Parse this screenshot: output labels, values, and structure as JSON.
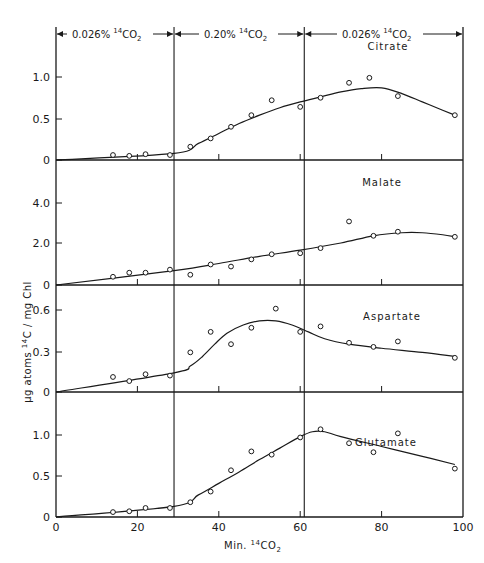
{
  "chart_data": {
    "type": "line",
    "title": "",
    "xlabel": "Min. 14CO2",
    "ylabel": "µg atoms 14C / mg Chl",
    "xlim": [
      0,
      100
    ],
    "x_ticks": [
      0,
      20,
      40,
      60,
      80,
      100
    ],
    "x_tick_labels": [
      "0",
      "20",
      "40",
      "60",
      "80",
      "100"
    ],
    "grid": false,
    "periods": [
      {
        "label": "0.026% 14CO2",
        "from": 0,
        "to": 29
      },
      {
        "label": "0.20% 14CO2",
        "from": 29,
        "to": 61
      },
      {
        "label": "0.026% 14CO2",
        "from": 61,
        "to": 100
      }
    ],
    "period_boundaries": [
      29,
      61
    ],
    "panels": [
      {
        "name": "Citrate",
        "ylim": [
          0,
          1.35
        ],
        "y_ticks": [
          0,
          0.5,
          1.0
        ],
        "y_tick_labels": [
          "0",
          "0.5",
          "1.0"
        ],
        "points": {
          "x": [
            14,
            18,
            22,
            28,
            33,
            38,
            43,
            48,
            53,
            60,
            65,
            72,
            77,
            84,
            98
          ],
          "y": [
            0.06,
            0.05,
            0.07,
            0.06,
            0.16,
            0.26,
            0.4,
            0.54,
            0.72,
            0.64,
            0.75,
            0.93,
            0.99,
            0.77,
            0.54
          ]
        },
        "curve": {
          "x": [
            0,
            29,
            35,
            40,
            45,
            50,
            55,
            60,
            65,
            70,
            75,
            80,
            85,
            90,
            95,
            98
          ],
          "y": [
            0.0,
            0.08,
            0.2,
            0.32,
            0.44,
            0.54,
            0.63,
            0.7,
            0.76,
            0.82,
            0.86,
            0.87,
            0.8,
            0.7,
            0.6,
            0.54
          ]
        }
      },
      {
        "name": "Malate",
        "ylim": [
          0,
          5.4
        ],
        "y_ticks": [
          0,
          2.0,
          4.0
        ],
        "y_tick_labels": [
          "0",
          "2.0",
          "4.0"
        ],
        "points": {
          "x": [
            14,
            18,
            22,
            28,
            33,
            38,
            43,
            48,
            53,
            60,
            65,
            72,
            78,
            84,
            98
          ],
          "y": [
            0.4,
            0.6,
            0.6,
            0.75,
            0.5,
            1.0,
            0.9,
            1.25,
            1.5,
            1.55,
            1.8,
            3.1,
            2.4,
            2.6,
            2.35
          ]
        },
        "curve": {
          "x": [
            0,
            29,
            40,
            50,
            60,
            70,
            78,
            85,
            90,
            95,
            98
          ],
          "y": [
            0.0,
            0.7,
            1.05,
            1.4,
            1.7,
            2.05,
            2.4,
            2.55,
            2.55,
            2.45,
            2.35
          ]
        }
      },
      {
        "name": "Aspartate",
        "ylim": [
          0,
          0.79
        ],
        "y_ticks": [
          0,
          0.3,
          0.6
        ],
        "y_tick_labels": [
          "0",
          "0.3",
          "0.6"
        ],
        "points": {
          "x": [
            14,
            18,
            22,
            28,
            33,
            38,
            43,
            48,
            54,
            60,
            65,
            72,
            78,
            84,
            98
          ],
          "y": [
            0.11,
            0.08,
            0.13,
            0.12,
            0.29,
            0.44,
            0.35,
            0.47,
            0.61,
            0.44,
            0.48,
            0.36,
            0.33,
            0.37,
            0.25
          ]
        },
        "curve": {
          "x": [
            0,
            29,
            33,
            36,
            39,
            42,
            46,
            50,
            54,
            58,
            62,
            66,
            72,
            80,
            90,
            98
          ],
          "y": [
            0.0,
            0.14,
            0.19,
            0.26,
            0.35,
            0.43,
            0.49,
            0.52,
            0.52,
            0.49,
            0.44,
            0.39,
            0.35,
            0.32,
            0.29,
            0.26
          ]
        }
      },
      {
        "name": "Glutamate",
        "ylim": [
          0,
          1.38
        ],
        "y_ticks": [
          0,
          0.5,
          1.0
        ],
        "y_tick_labels": [
          "0",
          "0.5",
          "1.0"
        ],
        "points": {
          "x": [
            14,
            18,
            22,
            28,
            33,
            38,
            43,
            48,
            53,
            60,
            65,
            72,
            78,
            84,
            98
          ],
          "y": [
            0.06,
            0.07,
            0.11,
            0.11,
            0.18,
            0.31,
            0.57,
            0.8,
            0.76,
            0.97,
            1.07,
            0.9,
            0.79,
            1.02,
            0.59
          ]
        },
        "curve": {
          "x": [
            0,
            29,
            35,
            40,
            45,
            50,
            55,
            60,
            63,
            66,
            70,
            80,
            90,
            98
          ],
          "y": [
            0.0,
            0.13,
            0.27,
            0.41,
            0.55,
            0.7,
            0.84,
            0.98,
            1.04,
            1.04,
            0.98,
            0.86,
            0.74,
            0.64
          ]
        }
      }
    ]
  },
  "labels": {
    "period_1": "0.026%",
    "period_2": "0.20%",
    "period_3": "0.026%",
    "co2_sup": "14",
    "co2_main": "CO",
    "co2_sub": "2",
    "ylabel_pre": "µg atoms ",
    "ylabel_sup": "14",
    "ylabel_post": "C / mg Chl",
    "xlabel_pre": "Min. ",
    "xlabel_sup": "14",
    "xlabel_main": "CO",
    "xlabel_sub": "2"
  }
}
